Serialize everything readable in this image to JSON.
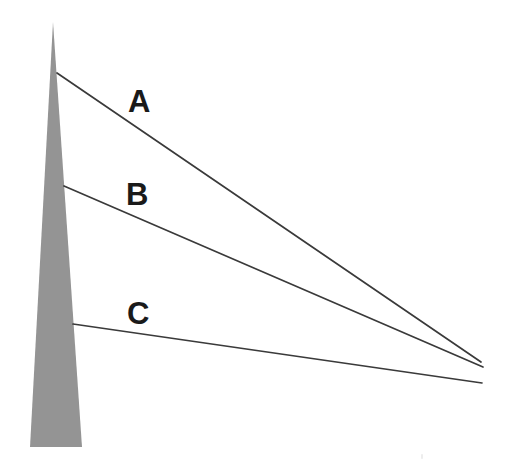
{
  "figure": {
    "background_color": "#ffffff",
    "width": 509,
    "height": 467
  },
  "spire": {
    "name": "tower-spire",
    "fill_color": "#949494",
    "apex": {
      "x": 53,
      "y": 22
    },
    "base_left": {
      "x": 30,
      "y": 447
    },
    "base_right": {
      "x": 82,
      "y": 447
    }
  },
  "labels": {
    "a": "A",
    "b": "B",
    "c": "C"
  },
  "lines": [
    {
      "id": "A",
      "label": "A",
      "stroke_color": "#3a3a3a",
      "stroke_width": 1.7,
      "start": {
        "x": 57,
        "y": 73
      },
      "end": {
        "x": 481,
        "y": 362
      },
      "label_position": {
        "x": 143,
        "y": 103
      }
    },
    {
      "id": "B",
      "label": "B",
      "stroke_color": "#3a3a3a",
      "stroke_width": 1.7,
      "start": {
        "x": 64,
        "y": 186
      },
      "end": {
        "x": 483,
        "y": 367
      },
      "label_position": {
        "x": 141,
        "y": 196
      }
    },
    {
      "id": "C",
      "label": "C",
      "stroke_color": "#3a3a3a",
      "stroke_width": 1.7,
      "start": {
        "x": 73,
        "y": 324
      },
      "end": {
        "x": 482,
        "y": 383
      },
      "label_position": {
        "x": 142,
        "y": 315
      }
    }
  ],
  "chart_data": {
    "type": "line",
    "xlabel": "",
    "ylabel": "",
    "xlim": [
      0,
      509
    ],
    "ylim": [
      467,
      0
    ],
    "grid": false,
    "legend": "none",
    "annotations": [
      "A",
      "B",
      "C"
    ],
    "shapes": [
      {
        "kind": "polygon",
        "name": "tower-spire",
        "fill": "#949494",
        "points": [
          [
            53,
            22
          ],
          [
            82,
            447
          ],
          [
            30,
            447
          ]
        ]
      }
    ],
    "series": [
      {
        "name": "A",
        "x": [
          57,
          481
        ],
        "y": [
          73,
          362
        ]
      },
      {
        "name": "B",
        "x": [
          64,
          483
        ],
        "y": [
          186,
          367
        ]
      },
      {
        "name": "C",
        "x": [
          73,
          482
        ],
        "y": [
          324,
          383
        ]
      }
    ]
  }
}
